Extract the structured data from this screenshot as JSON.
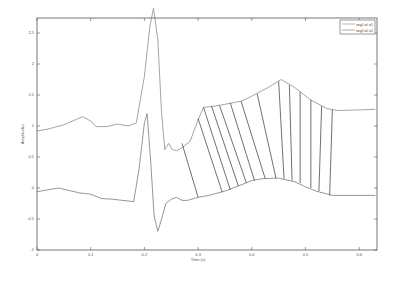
{
  "chart_data": {
    "type": "line",
    "title": "",
    "xlabel": "Time (s)",
    "ylabel": "Amplitudes",
    "xlim": [
      0,
      0.65
    ],
    "ylim": [
      -1,
      2.8
    ],
    "xticks": [
      0,
      0.1,
      0.2,
      0.3,
      0.4,
      0.5,
      0.6
    ],
    "xtick_labels": [
      "0",
      "0.1",
      "0.2",
      "0.3",
      "0.4",
      "0.5",
      "0.6"
    ],
    "yticks": [
      -1,
      -0.5,
      0,
      0.5,
      1,
      1.5,
      2,
      2.5
    ],
    "ytick_labels": [
      "-1",
      "-0.5",
      "0",
      "0.5",
      "1",
      "1.5",
      "2",
      "2.5"
    ],
    "grid": false,
    "legend_position": "upper right",
    "series": [
      {
        "name": "seg1 w/ o1",
        "x": [
          0,
          0.02,
          0.05,
          0.085,
          0.1,
          0.11,
          0.13,
          0.15,
          0.17,
          0.185,
          0.2,
          0.21,
          0.217,
          0.225,
          0.232,
          0.238,
          0.245,
          0.252,
          0.26,
          0.27,
          0.285,
          0.3,
          0.31,
          0.33,
          0.35,
          0.38,
          0.4,
          0.43,
          0.455,
          0.48,
          0.51,
          0.54,
          0.56,
          0.6,
          0.63
        ],
        "values": [
          0.92,
          0.95,
          1.02,
          1.15,
          1.08,
          0.99,
          0.99,
          1.03,
          1.0,
          1.05,
          1.8,
          2.6,
          2.9,
          2.4,
          1.2,
          0.62,
          0.72,
          0.62,
          0.6,
          0.65,
          0.75,
          1.1,
          1.3,
          1.32,
          1.35,
          1.4,
          1.48,
          1.62,
          1.75,
          1.62,
          1.42,
          1.28,
          1.25,
          1.26,
          1.27
        ]
      },
      {
        "name": "seg2 w/ o2",
        "x": [
          0,
          0.02,
          0.04,
          0.06,
          0.08,
          0.1,
          0.12,
          0.14,
          0.16,
          0.18,
          0.19,
          0.2,
          0.205,
          0.212,
          0.218,
          0.225,
          0.232,
          0.24,
          0.25,
          0.26,
          0.27,
          0.28,
          0.3,
          0.32,
          0.35,
          0.38,
          0.4,
          0.42,
          0.45,
          0.48,
          0.5,
          0.52,
          0.55,
          0.6,
          0.63
        ],
        "values": [
          -0.06,
          -0.03,
          0.0,
          -0.04,
          -0.08,
          -0.1,
          -0.17,
          -0.18,
          -0.2,
          -0.22,
          0.3,
          1.05,
          1.2,
          0.4,
          -0.45,
          -0.7,
          -0.5,
          -0.25,
          -0.18,
          -0.15,
          -0.2,
          -0.2,
          -0.15,
          -0.12,
          -0.05,
          0.05,
          0.12,
          0.15,
          0.16,
          0.1,
          0.02,
          -0.05,
          -0.12,
          -0.12,
          -0.12
        ]
      }
    ],
    "connectors": {
      "description": "Black alignment lines connecting points on seg1 to points on seg2",
      "pairs": [
        {
          "x1": 0.27,
          "y1": 0.72,
          "x2": 0.3,
          "y2": -0.15
        },
        {
          "x1": 0.3,
          "y1": 1.12,
          "x2": 0.345,
          "y2": -0.07
        },
        {
          "x1": 0.31,
          "y1": 1.3,
          "x2": 0.36,
          "y2": -0.03
        },
        {
          "x1": 0.325,
          "y1": 1.32,
          "x2": 0.375,
          "y2": 0.03
        },
        {
          "x1": 0.34,
          "y1": 1.33,
          "x2": 0.39,
          "y2": 0.08
        },
        {
          "x1": 0.36,
          "y1": 1.37,
          "x2": 0.405,
          "y2": 0.12
        },
        {
          "x1": 0.38,
          "y1": 1.4,
          "x2": 0.425,
          "y2": 0.15
        },
        {
          "x1": 0.41,
          "y1": 1.52,
          "x2": 0.445,
          "y2": 0.16
        },
        {
          "x1": 0.45,
          "y1": 1.72,
          "x2": 0.46,
          "y2": 0.15
        },
        {
          "x1": 0.47,
          "y1": 1.66,
          "x2": 0.475,
          "y2": 0.12
        },
        {
          "x1": 0.49,
          "y1": 1.55,
          "x2": 0.49,
          "y2": 0.08
        },
        {
          "x1": 0.51,
          "y1": 1.42,
          "x2": 0.51,
          "y2": 0.0
        },
        {
          "x1": 0.53,
          "y1": 1.32,
          "x2": 0.525,
          "y2": -0.05
        },
        {
          "x1": 0.55,
          "y1": 1.26,
          "x2": 0.545,
          "y2": -0.12
        }
      ]
    }
  },
  "colors": {
    "series": [
      "#9a9a9a",
      "#8a8a8a"
    ],
    "connector": "#333333",
    "axes": "#444444"
  }
}
